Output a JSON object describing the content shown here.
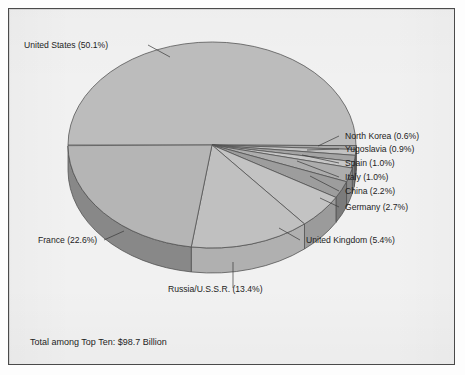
{
  "figure": {
    "background_color": "#f1f1f1",
    "border_color": "#4a4a4a",
    "footnote": "Total among Top Ten: $98.7 Billion"
  },
  "chart_data": {
    "type": "pie",
    "title": "",
    "subtitle": "",
    "xlabel": "",
    "ylabel": "",
    "legend_position": "none",
    "grid": false,
    "three_d": true,
    "total_label": "Total among Top Ten: $98.7 Billion",
    "total_value": 98.7,
    "total_units": "Billion USD",
    "categories": [
      "United States",
      "North Korea",
      "Yugoslavia",
      "Spain",
      "Italy",
      "China",
      "Germany",
      "United Kingdom",
      "Russia/U.S.S.R.",
      "France"
    ],
    "values": [
      50.1,
      0.6,
      0.9,
      1.0,
      1.0,
      2.2,
      2.7,
      5.4,
      13.4,
      22.6
    ],
    "slices": [
      {
        "name": "United States",
        "percent": 50.1,
        "label": "United States (50.1%)",
        "top_color": "#bcbcbc",
        "side_color": "#8f8f8f"
      },
      {
        "name": "North Korea",
        "percent": 0.6,
        "label": "North Korea (0.6%)",
        "top_color": "#a8a8a8",
        "side_color": "#858585"
      },
      {
        "name": "Yugoslavia",
        "percent": 0.9,
        "label": "Yugoslavia (0.9%)",
        "top_color": "#c2c2c2",
        "side_color": "#949494"
      },
      {
        "name": "Spain",
        "percent": 1.0,
        "label": "Spain (1.0%)",
        "top_color": "#a4a4a4",
        "side_color": "#828282"
      },
      {
        "name": "Italy",
        "percent": 1.0,
        "label": "Italy (1.0%)",
        "top_color": "#c6c6c6",
        "side_color": "#969696"
      },
      {
        "name": "China",
        "percent": 2.2,
        "label": "China (2.2%)",
        "top_color": "#adadad",
        "side_color": "#8a8a8a"
      },
      {
        "name": "Germany",
        "percent": 2.7,
        "label": "Germany (2.7%)",
        "top_color": "#9d9d9d",
        "side_color": "#7b7b7b"
      },
      {
        "name": "United Kingdom",
        "percent": 5.4,
        "label": "United Kingdom (5.4%)",
        "top_color": "#c3c3c3",
        "side_color": "#9b9b9b"
      },
      {
        "name": "Russia/U.S.S.R.",
        "percent": 13.4,
        "label": "Russia/U.S.S.R. (13.4%)",
        "top_color": "#c0c0c0",
        "side_color": "#b0b0b0"
      },
      {
        "name": "France",
        "percent": 22.6,
        "label": "France (22.6%)",
        "top_color": "#b5b5b5",
        "side_color": "#888888"
      }
    ],
    "labels": {
      "united_states": "United States (50.1%)",
      "north_korea": "North Korea (0.6%)",
      "yugoslavia": "Yugoslavia (0.9%)",
      "spain": "Spain (1.0%)",
      "italy": "Italy (1.0%)",
      "china": "China (2.2%)",
      "germany": "Germany (2.7%)",
      "united_kingdom": "United Kingdom (5.4%)",
      "russia_ussr": "Russia/U.S.S.R. (13.4%)",
      "france": "France (22.6%)"
    },
    "geometry": {
      "cx": 212,
      "cy": 145,
      "rx": 144,
      "ry": 103,
      "depth": 25,
      "start_angle_deg": 180,
      "direction": "clockwise"
    }
  }
}
